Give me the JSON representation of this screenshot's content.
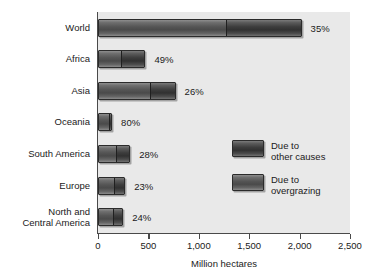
{
  "chart_data": {
    "type": "bar",
    "orientation": "horizontal",
    "stacked": true,
    "title": "",
    "xlabel": "Million hectares",
    "ylabel": "",
    "xlim": [
      0,
      2500
    ],
    "grid": false,
    "legend_position": "inside-right",
    "categories": [
      "World",
      "Africa",
      "Asia",
      "Oceania",
      "South America",
      "Europe",
      "North and\nCentral America"
    ],
    "tick_labels": [
      "0",
      "500",
      "1,000",
      "1,500",
      "2,000",
      "2,500"
    ],
    "tick_values": [
      0,
      500,
      1000,
      1500,
      2000,
      2500
    ],
    "series": [
      {
        "name": "Due to overgrazing",
        "color": "#4a4a4a",
        "values": [
          1270,
          225,
          520,
          110,
          180,
          160,
          155
        ]
      },
      {
        "name": "Due to other causes",
        "color": "#313131",
        "values": [
          750,
          245,
          250,
          30,
          140,
          110,
          95
        ]
      }
    ],
    "point_labels": [
      "35%",
      "49%",
      "26%",
      "80%",
      "28%",
      "23%",
      "24%"
    ],
    "totals": [
      2020,
      470,
      770,
      140,
      320,
      270,
      250
    ]
  },
  "legend": {
    "items": [
      {
        "label": "Due to\nother causes",
        "swatch": "other-causes"
      },
      {
        "label": "Due to\novergrazing",
        "swatch": "overgrazing"
      }
    ]
  }
}
